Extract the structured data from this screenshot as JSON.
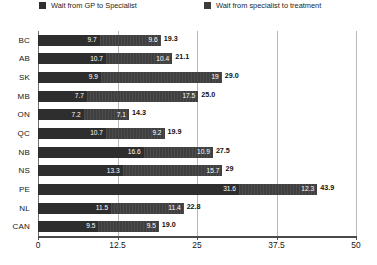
{
  "chart_data": {
    "type": "bar",
    "orientation": "horizontal",
    "stacked": true,
    "title": "",
    "xlabel": "",
    "ylabel": "",
    "xlim": [
      0,
      50
    ],
    "xticks": [
      "0",
      "12.5",
      "25",
      "37.5",
      "50"
    ],
    "xtick_values": [
      0,
      12.5,
      25,
      37.5,
      50
    ],
    "grid": true,
    "grid_axis": "x",
    "legend_position": "top",
    "categories": [
      "BC",
      "AB",
      "SK",
      "MB",
      "ON",
      "QC",
      "NB",
      "NS",
      "PE",
      "NL",
      "CAN"
    ],
    "series": [
      {
        "name": "Wait from GP to Specialist",
        "color": "#2e2e2e",
        "values": [
          9.7,
          10.7,
          9.9,
          7.7,
          7.2,
          10.7,
          16.6,
          13.3,
          31.6,
          11.5,
          9.5
        ],
        "labels": [
          "9.7",
          "10.7",
          "9.9",
          "7.7",
          "7.2",
          "10.7",
          "16.6",
          "13.3",
          "31.6",
          "11.5",
          "9.5"
        ]
      },
      {
        "name": "Wait from specialist to treatment",
        "color": "#3f3f3f",
        "values": [
          9.6,
          10.4,
          19,
          17.5,
          7.1,
          9.2,
          10.9,
          15.7,
          12.3,
          11.4,
          9.5
        ],
        "labels": [
          "9.6",
          "10.4",
          "19",
          "17.5",
          "7.1",
          "9.2",
          "10.9",
          "15.7",
          "12.3",
          "11.4",
          "9.5"
        ]
      }
    ],
    "totals": [
      19.3,
      21.1,
      29.0,
      25.0,
      14.3,
      19.9,
      27.5,
      29,
      43.9,
      22.8,
      19.0
    ],
    "total_labels": [
      "19.3",
      "21.1",
      "29.0",
      "25.0",
      "14.3",
      "19.9",
      "27.5",
      "29",
      "43.9",
      "22.8",
      "19.0"
    ]
  },
  "legend": {
    "items": [
      {
        "label": "Wait from GP to Specialist",
        "swatch": "legend-swatch-gp-to-specialist"
      },
      {
        "label": "Wait from specialist to treatment",
        "swatch": "legend-swatch-specialist-to-treatment"
      }
    ]
  }
}
